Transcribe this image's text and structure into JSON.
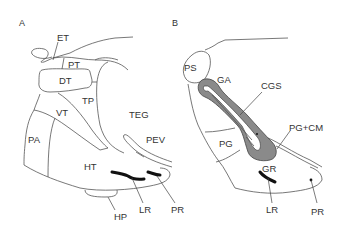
{
  "figure": {
    "panels": [
      {
        "id": "A",
        "label": "A",
        "regions": {
          "ET": "ET",
          "PT": "PT",
          "DT": "DT",
          "TP": "TP",
          "VT": "VT",
          "TEG": "TEG",
          "PA": "PA",
          "PEV": "PEV",
          "HT": "HT",
          "HP": "HP",
          "LR": "LR",
          "PR": "PR"
        }
      },
      {
        "id": "B",
        "label": "B",
        "regions": {
          "PS": "PS",
          "GA": "GA",
          "CGS": "CGS",
          "PG_CM": "PG+CM",
          "PG": "PG",
          "GR": "GR",
          "LR": "LR",
          "PR": "PR"
        }
      }
    ],
    "colors": {
      "line": "#555555",
      "thick_structure": "#111111",
      "shaded_region": "#8a8a8a",
      "text": "#333333",
      "background": "#ffffff"
    }
  }
}
